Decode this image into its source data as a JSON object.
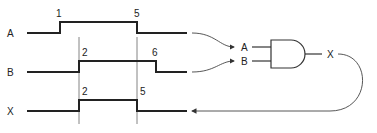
{
  "signals": [
    {
      "name": "A",
      "label": "A",
      "edges": [
        "1",
        "5"
      ]
    },
    {
      "name": "B",
      "label": "B",
      "edges": [
        "2",
        "6"
      ]
    },
    {
      "name": "X",
      "label": "X",
      "edges": [
        "2",
        "5"
      ]
    }
  ],
  "gate": {
    "type": "AND",
    "inputs": [
      "A",
      "B"
    ],
    "output": "X"
  },
  "colors": {
    "ink": "#222222",
    "background": "#ffffff"
  }
}
